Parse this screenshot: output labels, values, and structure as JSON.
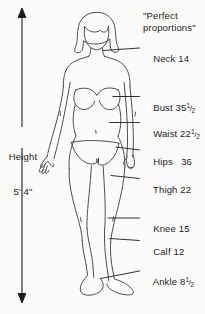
{
  "diagram": {
    "title_line1": "\"Perfect",
    "title_line2": "proportions\"",
    "height": {
      "label_line1": "Height",
      "label_line2": "5' 4\""
    },
    "measurements": [
      {
        "name": "Neck",
        "value": "14",
        "text": "Neck 14"
      },
      {
        "name": "Bust",
        "value": "35½",
        "text": "Bust 35"
      },
      {
        "name": "Waist",
        "value": "22½",
        "text": "Waist 22"
      },
      {
        "name": "Hips",
        "value": "36",
        "text": "Hips   36"
      },
      {
        "name": "Thigh",
        "value": "22",
        "text": "Thigh 22"
      },
      {
        "name": "Knee",
        "value": "15",
        "text": "Knee 15"
      },
      {
        "name": "Calf",
        "value": "12",
        "text": "Calf 12"
      },
      {
        "name": "Ankle",
        "value": "8½",
        "text": "Ankle 8"
      }
    ],
    "fraction": {
      "numerator": "1",
      "bar": "/",
      "denominator": "2"
    },
    "colors": {
      "background": "#fbfbf9",
      "ink": "#1c1c1c",
      "outline": "#3a3a3a"
    }
  }
}
